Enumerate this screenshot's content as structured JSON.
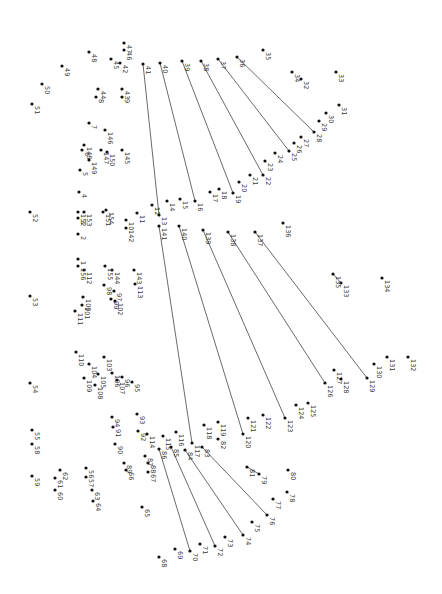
{
  "puzzle": {
    "type": "dot-to-dot",
    "orientation": "rotated-90-clockwise",
    "dot_color": "#111111",
    "line_color": "#444444",
    "label_color": "#333333",
    "points": [
      {
        "n": "1",
        "x": 78,
        "y": 259
      },
      {
        "n": "2",
        "x": 78,
        "y": 234
      },
      {
        "n": "3",
        "x": 78,
        "y": 218
      },
      {
        "n": "4",
        "x": 79,
        "y": 192
      },
      {
        "n": "5",
        "x": 80,
        "y": 170
      },
      {
        "n": "6",
        "x": 82,
        "y": 150
      },
      {
        "n": "7",
        "x": 89,
        "y": 123
      },
      {
        "n": "8",
        "x": 96,
        "y": 97
      },
      {
        "n": "9",
        "x": 122,
        "y": 97
      },
      {
        "n": "10",
        "x": 126,
        "y": 220
      },
      {
        "n": "11",
        "x": 137,
        "y": 213
      },
      {
        "n": "12",
        "x": 152,
        "y": 205
      },
      {
        "n": "13",
        "x": 159,
        "y": 215
      },
      {
        "n": "14",
        "x": 167,
        "y": 201
      },
      {
        "n": "15",
        "x": 180,
        "y": 199
      },
      {
        "n": "16",
        "x": 195,
        "y": 201
      },
      {
        "n": "17",
        "x": 210,
        "y": 192
      },
      {
        "n": "18",
        "x": 219,
        "y": 189
      },
      {
        "n": "19",
        "x": 233,
        "y": 193
      },
      {
        "n": "20",
        "x": 239,
        "y": 182
      },
      {
        "n": "21",
        "x": 250,
        "y": 175
      },
      {
        "n": "22",
        "x": 263,
        "y": 175
      },
      {
        "n": "23",
        "x": 265,
        "y": 161
      },
      {
        "n": "24",
        "x": 275,
        "y": 153
      },
      {
        "n": "25",
        "x": 289,
        "y": 151
      },
      {
        "n": "26",
        "x": 294,
        "y": 143
      },
      {
        "n": "27",
        "x": 301,
        "y": 137
      },
      {
        "n": "28",
        "x": 314,
        "y": 132
      },
      {
        "n": "29",
        "x": 319,
        "y": 121
      },
      {
        "n": "30",
        "x": 326,
        "y": 113
      },
      {
        "n": "31",
        "x": 339,
        "y": 105
      },
      {
        "n": "33",
        "x": 336,
        "y": 72
      },
      {
        "n": "32",
        "x": 301,
        "y": 79
      },
      {
        "n": "34",
        "x": 292,
        "y": 72
      },
      {
        "n": "35",
        "x": 263,
        "y": 50
      },
      {
        "n": "36",
        "x": 237,
        "y": 57
      },
      {
        "n": "37",
        "x": 218,
        "y": 59
      },
      {
        "n": "38",
        "x": 201,
        "y": 61
      },
      {
        "n": "39",
        "x": 182,
        "y": 61
      },
      {
        "n": "40",
        "x": 160,
        "y": 63
      },
      {
        "n": "41",
        "x": 143,
        "y": 64
      },
      {
        "n": "42",
        "x": 120,
        "y": 63
      },
      {
        "n": "43",
        "x": 122,
        "y": 89
      },
      {
        "n": "44",
        "x": 98,
        "y": 89
      },
      {
        "n": "45",
        "x": 111,
        "y": 59
      },
      {
        "n": "46",
        "x": 124,
        "y": 50
      },
      {
        "n": "47",
        "x": 124,
        "y": 43
      },
      {
        "n": "48",
        "x": 89,
        "y": 52
      },
      {
        "n": "49",
        "x": 62,
        "y": 66
      },
      {
        "n": "50",
        "x": 42,
        "y": 84
      },
      {
        "n": "51",
        "x": 32,
        "y": 104
      },
      {
        "n": "52",
        "x": 30,
        "y": 212
      },
      {
        "n": "53",
        "x": 30,
        "y": 296
      },
      {
        "n": "54",
        "x": 30,
        "y": 383
      },
      {
        "n": "55",
        "x": 32,
        "y": 430
      },
      {
        "n": "58",
        "x": 32,
        "y": 444
      },
      {
        "n": "59",
        "x": 32,
        "y": 476
      },
      {
        "n": "56",
        "x": 86,
        "y": 468
      },
      {
        "n": "57",
        "x": 86,
        "y": 477
      },
      {
        "n": "62",
        "x": 60,
        "y": 470
      },
      {
        "n": "61",
        "x": 55,
        "y": 478
      },
      {
        "n": "60",
        "x": 55,
        "y": 490
      },
      {
        "n": "63",
        "x": 92,
        "y": 490
      },
      {
        "n": "64",
        "x": 93,
        "y": 501
      },
      {
        "n": "65",
        "x": 142,
        "y": 507
      },
      {
        "n": "66",
        "x": 126,
        "y": 470
      },
      {
        "n": "67",
        "x": 148,
        "y": 472
      },
      {
        "n": "68",
        "x": 159,
        "y": 557
      },
      {
        "n": "69",
        "x": 175,
        "y": 549
      },
      {
        "n": "70",
        "x": 190,
        "y": 551
      },
      {
        "n": "71",
        "x": 200,
        "y": 544
      },
      {
        "n": "72",
        "x": 215,
        "y": 546
      },
      {
        "n": "73",
        "x": 225,
        "y": 537
      },
      {
        "n": "74",
        "x": 243,
        "y": 535
      },
      {
        "n": "75",
        "x": 252,
        "y": 522
      },
      {
        "n": "76",
        "x": 267,
        "y": 515
      },
      {
        "n": "77",
        "x": 273,
        "y": 499
      },
      {
        "n": "78",
        "x": 287,
        "y": 492
      },
      {
        "n": "79",
        "x": 259,
        "y": 474
      },
      {
        "n": "80",
        "x": 288,
        "y": 470
      },
      {
        "n": "81",
        "x": 247,
        "y": 467
      },
      {
        "n": "82",
        "x": 218,
        "y": 439
      },
      {
        "n": "83",
        "x": 202,
        "y": 447
      },
      {
        "n": "84",
        "x": 185,
        "y": 450
      },
      {
        "n": "85",
        "x": 171,
        "y": 447
      },
      {
        "n": "86",
        "x": 159,
        "y": 449
      },
      {
        "n": "87",
        "x": 145,
        "y": 456
      },
      {
        "n": "88",
        "x": 148,
        "y": 463
      },
      {
        "n": "89",
        "x": 124,
        "y": 463
      },
      {
        "n": "90",
        "x": 115,
        "y": 444
      },
      {
        "n": "91",
        "x": 113,
        "y": 427
      },
      {
        "n": "92",
        "x": 138,
        "y": 431
      },
      {
        "n": "93",
        "x": 137,
        "y": 414
      },
      {
        "n": "94",
        "x": 112,
        "y": 417
      },
      {
        "n": "95",
        "x": 132,
        "y": 382
      },
      {
        "n": "96",
        "x": 122,
        "y": 377
      },
      {
        "n": "97",
        "x": 114,
        "y": 291
      },
      {
        "n": "98",
        "x": 104,
        "y": 285
      },
      {
        "n": "99",
        "x": 111,
        "y": 299
      },
      {
        "n": "100",
        "x": 83,
        "y": 297
      },
      {
        "n": "101",
        "x": 82,
        "y": 305
      },
      {
        "n": "102",
        "x": 115,
        "y": 301
      },
      {
        "n": "103",
        "x": 104,
        "y": 357
      },
      {
        "n": "104",
        "x": 89,
        "y": 364
      },
      {
        "n": "105",
        "x": 98,
        "y": 374
      },
      {
        "n": "106",
        "x": 112,
        "y": 373
      },
      {
        "n": "107",
        "x": 117,
        "y": 380
      },
      {
        "n": "108",
        "x": 95,
        "y": 385
      },
      {
        "n": "109",
        "x": 84,
        "y": 378
      },
      {
        "n": "110",
        "x": 76,
        "y": 352
      },
      {
        "n": "111",
        "x": 75,
        "y": 311
      },
      {
        "n": "112",
        "x": 84,
        "y": 270
      },
      {
        "n": "113",
        "x": 135,
        "y": 284
      },
      {
        "n": "114",
        "x": 147,
        "y": 434
      },
      {
        "n": "115",
        "x": 163,
        "y": 436
      },
      {
        "n": "116",
        "x": 176,
        "y": 432
      },
      {
        "n": "117",
        "x": 192,
        "y": 443
      },
      {
        "n": "118",
        "x": 204,
        "y": 425
      },
      {
        "n": "119",
        "x": 218,
        "y": 422
      },
      {
        "n": "120",
        "x": 243,
        "y": 434
      },
      {
        "n": "121",
        "x": 248,
        "y": 418
      },
      {
        "n": "122",
        "x": 263,
        "y": 415
      },
      {
        "n": "123",
        "x": 285,
        "y": 418
      },
      {
        "n": "124",
        "x": 296,
        "y": 405
      },
      {
        "n": "125",
        "x": 308,
        "y": 403
      },
      {
        "n": "126",
        "x": 325,
        "y": 383
      },
      {
        "n": "127",
        "x": 334,
        "y": 370
      },
      {
        "n": "128",
        "x": 341,
        "y": 379
      },
      {
        "n": "129",
        "x": 367,
        "y": 378
      },
      {
        "n": "130",
        "x": 374,
        "y": 364
      },
      {
        "n": "131",
        "x": 387,
        "y": 357
      },
      {
        "n": "132",
        "x": 408,
        "y": 357
      },
      {
        "n": "133",
        "x": 341,
        "y": 283
      },
      {
        "n": "134",
        "x": 382,
        "y": 278
      },
      {
        "n": "135",
        "x": 333,
        "y": 274
      },
      {
        "n": "136",
        "x": 283,
        "y": 223
      },
      {
        "n": "137",
        "x": 255,
        "y": 232
      },
      {
        "n": "138",
        "x": 228,
        "y": 232
      },
      {
        "n": "139",
        "x": 203,
        "y": 230
      },
      {
        "n": "140",
        "x": 179,
        "y": 226
      },
      {
        "n": "141",
        "x": 159,
        "y": 226
      },
      {
        "n": "142",
        "x": 126,
        "y": 228
      },
      {
        "n": "143",
        "x": 134,
        "y": 270
      },
      {
        "n": "144",
        "x": 112,
        "y": 270
      },
      {
        "n": "145",
        "x": 122,
        "y": 150
      },
      {
        "n": "146",
        "x": 105,
        "y": 130
      },
      {
        "n": "147",
        "x": 101,
        "y": 150
      },
      {
        "n": "148",
        "x": 84,
        "y": 145
      },
      {
        "n": "149",
        "x": 89,
        "y": 160
      },
      {
        "n": "150",
        "x": 107,
        "y": 152
      },
      {
        "n": "151",
        "x": 103,
        "y": 212
      },
      {
        "n": "152",
        "x": 78,
        "y": 212
      },
      {
        "n": "153",
        "x": 84,
        "y": 212
      },
      {
        "n": "154",
        "x": 106,
        "y": 210
      },
      {
        "n": "155",
        "x": 105,
        "y": 266
      },
      {
        "n": "156",
        "x": 78,
        "y": 266
      }
    ],
    "connected_segments": [
      [
        "36",
        "28"
      ],
      [
        "37",
        "25"
      ],
      [
        "38",
        "22"
      ],
      [
        "39",
        "19"
      ],
      [
        "40",
        "16"
      ],
      [
        "41",
        "13"
      ],
      [
        "135",
        "133"
      ],
      [
        "137",
        "129"
      ],
      [
        "138",
        "126"
      ],
      [
        "139",
        "123"
      ],
      [
        "140",
        "120"
      ],
      [
        "141",
        "117"
      ],
      [
        "81",
        "79"
      ],
      [
        "83",
        "76"
      ],
      [
        "84",
        "74"
      ],
      [
        "85",
        "72"
      ],
      [
        "86",
        "70"
      ]
    ]
  }
}
